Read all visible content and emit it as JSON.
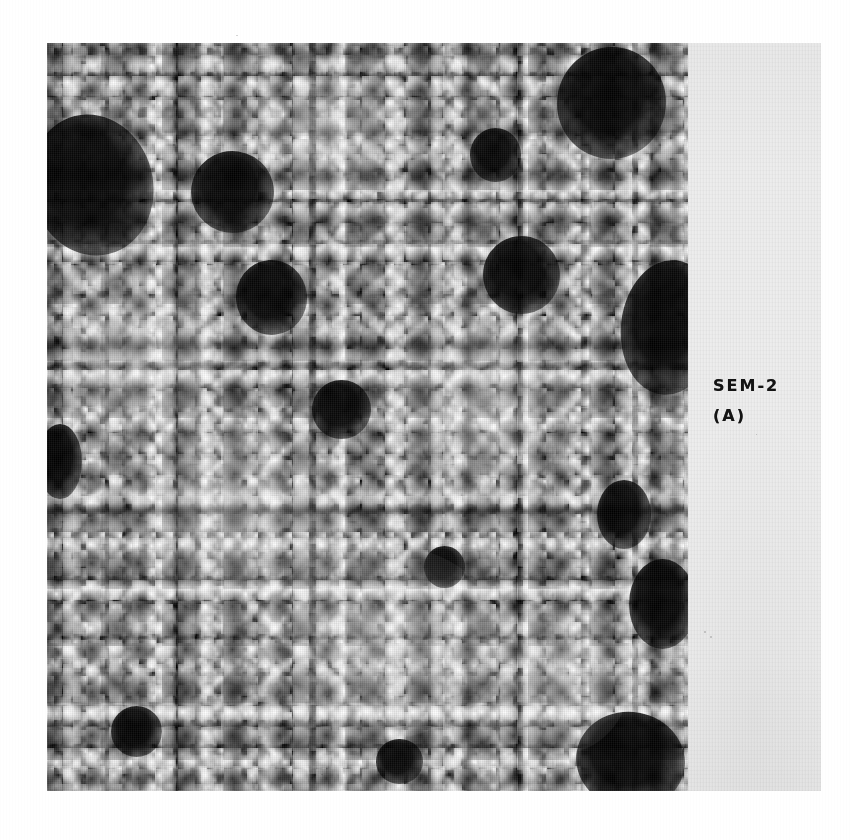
{
  "figure": {
    "kind": "sem-micrograph-figure",
    "caption_lines": [
      "SEM-2",
      "(A)"
    ],
    "caption_full": "SEM-2 (A)",
    "label_panel": {
      "background_color": "#ececec",
      "text_color": "#141414"
    },
    "micrograph": {
      "description": "Scanning electron micrograph of densely packed granular particles with dark pores",
      "background_color": "#0d0d0d",
      "particle_color": "#f2f2f2",
      "pore_color": "#000000",
      "pores": [
        {
          "cx": 7,
          "cy": 19,
          "rx": 9.5,
          "ry": 9.5,
          "rot": -14
        },
        {
          "cx": 29,
          "cy": 20,
          "rx": 6.5,
          "ry": 5.5,
          "rot": 8
        },
        {
          "cx": 35,
          "cy": 34,
          "rx": 5.5,
          "ry": 5.0,
          "rot": -5
        },
        {
          "cx": 88,
          "cy": 8,
          "rx": 8.5,
          "ry": 7.5,
          "rot": 12
        },
        {
          "cx": 70,
          "cy": 15,
          "rx": 4.0,
          "ry": 3.6,
          "rot": 0
        },
        {
          "cx": 74,
          "cy": 31,
          "rx": 6.0,
          "ry": 5.2,
          "rot": -9
        },
        {
          "cx": 97,
          "cy": 38,
          "rx": 7.5,
          "ry": 9.0,
          "rot": 6
        },
        {
          "cx": 46,
          "cy": 49,
          "rx": 4.6,
          "ry": 4.0,
          "rot": 0
        },
        {
          "cx": 90,
          "cy": 63,
          "rx": 4.2,
          "ry": 4.6,
          "rot": 0
        },
        {
          "cx": 96,
          "cy": 75,
          "rx": 5.2,
          "ry": 6.0,
          "rot": 0
        },
        {
          "cx": 91,
          "cy": 96,
          "rx": 8.5,
          "ry": 6.5,
          "rot": 10
        },
        {
          "cx": 14,
          "cy": 92,
          "rx": 4.0,
          "ry": 3.4,
          "rot": 0
        },
        {
          "cx": 55,
          "cy": 96,
          "rx": 3.6,
          "ry": 3.0,
          "rot": 0
        },
        {
          "cx": 2,
          "cy": 56,
          "rx": 3.4,
          "ry": 5.0,
          "rot": 0
        },
        {
          "cx": 62,
          "cy": 70,
          "rx": 3.2,
          "ry": 2.8,
          "rot": 0
        }
      ],
      "bright_regions": [
        {
          "cx": 30,
          "cy": 63,
          "rx": 17,
          "ry": 14
        },
        {
          "cx": 52,
          "cy": 80,
          "rx": 19,
          "ry": 13
        },
        {
          "cx": 68,
          "cy": 48,
          "rx": 14,
          "ry": 12
        },
        {
          "cx": 15,
          "cy": 42,
          "rx": 12,
          "ry": 11
        },
        {
          "cx": 44,
          "cy": 12,
          "rx": 13,
          "ry": 8
        },
        {
          "cx": 80,
          "cy": 85,
          "rx": 11,
          "ry": 10
        }
      ]
    }
  }
}
